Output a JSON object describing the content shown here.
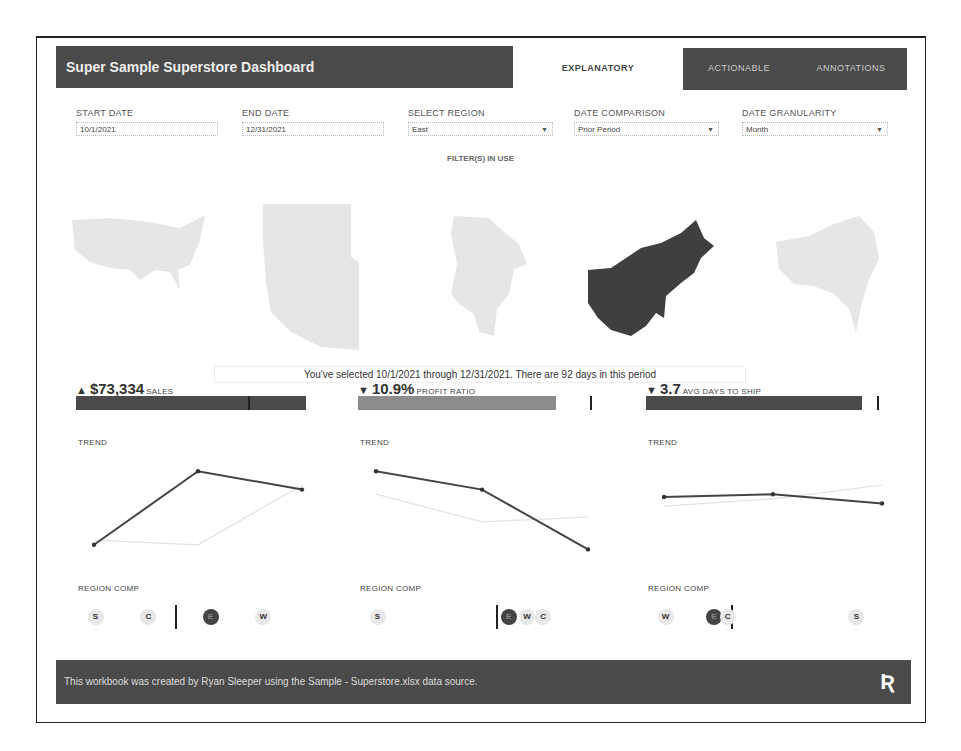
{
  "header": {
    "title": "Super Sample Superstore Dashboard",
    "tabs": [
      {
        "label": "EXPLANATORY",
        "active": true
      },
      {
        "label": "ACTIONABLE",
        "active": false
      },
      {
        "label": "ANNOTATIONS",
        "active": false
      }
    ]
  },
  "filters": {
    "start_date": {
      "label": "START DATE",
      "value": "10/1/2021"
    },
    "end_date": {
      "label": "END DATE",
      "value": "12/31/2021"
    },
    "region": {
      "label": "SELECT REGION",
      "value": "East"
    },
    "comparison": {
      "label": "DATE COMPARISON",
      "value": "Prior Period"
    },
    "granularity": {
      "label": "DATE GRANULARITY",
      "value": "Month"
    },
    "in_use_label": "FILTER(S) IN USE"
  },
  "maps": {
    "items": [
      {
        "region": "All",
        "selected": false
      },
      {
        "region": "West",
        "selected": false
      },
      {
        "region": "Central",
        "selected": false
      },
      {
        "region": "East",
        "selected": true
      },
      {
        "region": "South",
        "selected": false
      }
    ],
    "selected_color": "#3f3f3f",
    "unselected_color": "#e6e6e6"
  },
  "selection_text": "You've selected 10/1/2021 through 12/31/2021. There are 92 days in this period",
  "kpis": [
    {
      "arrow": "▲",
      "value": "$73,334",
      "name": "SALES",
      "bar_color": "#4a4a4a",
      "target_fraction": 0.75,
      "trend_label": "TREND",
      "trend_current": [
        10,
        90,
        70
      ],
      "trend_prior": [
        15,
        10,
        75
      ],
      "region_label": "REGION COMP",
      "regions": [
        {
          "code": "S",
          "pos": 0.05,
          "selected": false
        },
        {
          "code": "C",
          "pos": 0.28,
          "selected": false
        },
        {
          "code": "E",
          "pos": 0.55,
          "selected": true
        },
        {
          "code": "W",
          "pos": 0.78,
          "selected": false
        }
      ],
      "region_marker": 0.43
    },
    {
      "arrow": "▼",
      "value": "10.9%",
      "name": "PROFIT RATIO",
      "bar_color": "#8c8c8c",
      "target_fraction": 1.0,
      "trend_label": "TREND",
      "trend_current": [
        90,
        70,
        5
      ],
      "trend_prior": [
        65,
        35,
        40
      ],
      "region_label": "REGION COMP",
      "regions": [
        {
          "code": "S",
          "pos": 0.05,
          "selected": false
        },
        {
          "code": "E",
          "pos": 0.62,
          "selected": true
        },
        {
          "code": "W",
          "pos": 0.7,
          "selected": false
        },
        {
          "code": "C",
          "pos": 0.77,
          "selected": false
        }
      ],
      "region_marker": 0.6
    },
    {
      "arrow": "▼",
      "value": "3.7",
      "name": "AVG DAYS TO SHIP",
      "bar_color": "#4a4a4a",
      "target_fraction": 1.0,
      "trend_label": "TREND",
      "trend_current": [
        62,
        65,
        55
      ],
      "trend_prior": [
        52,
        60,
        75
      ],
      "region_label": "REGION COMP",
      "regions": [
        {
          "code": "W",
          "pos": 0.05,
          "selected": false
        },
        {
          "code": "E",
          "pos": 0.26,
          "selected": true
        },
        {
          "code": "C",
          "pos": 0.32,
          "selected": false
        },
        {
          "code": "S",
          "pos": 0.88,
          "selected": false
        }
      ],
      "region_marker": 0.37
    }
  ],
  "footer": {
    "text": "This workbook was created by Ryan Sleeper using the Sample - Superstore.xlsx data source.",
    "logo": "Ʀ"
  }
}
